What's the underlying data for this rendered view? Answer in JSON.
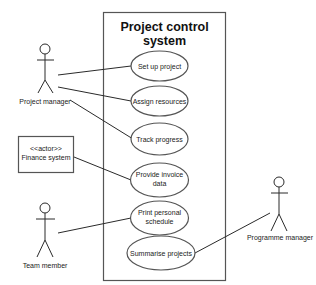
{
  "system": {
    "title_line1": "Project control",
    "title_line2": "system"
  },
  "use_cases": [
    {
      "line1": "Set up project",
      "line2": ""
    },
    {
      "line1": "Assign resources",
      "line2": ""
    },
    {
      "line1": "Track progress",
      "line2": ""
    },
    {
      "line1": "Provide invoice",
      "line2": "data"
    },
    {
      "line1": "Print personal",
      "line2": "schedule"
    },
    {
      "line1": "Summarise projects",
      "line2": ""
    }
  ],
  "actors": {
    "project_manager": "Project manager",
    "finance_system_stereotype": "<<actor>>",
    "finance_system": "Finance system",
    "team_member": "Team member",
    "programme_manager": "Programme manager"
  },
  "associations": [
    {
      "from": "Project manager",
      "to": "Set up project"
    },
    {
      "from": "Project manager",
      "to": "Assign resources"
    },
    {
      "from": "Project manager",
      "to": "Track progress"
    },
    {
      "from": "Finance system",
      "to": "Provide invoice data"
    },
    {
      "from": "Team member",
      "to": "Print personal schedule"
    },
    {
      "from": "Programme manager",
      "to": "Summarise projects"
    }
  ]
}
